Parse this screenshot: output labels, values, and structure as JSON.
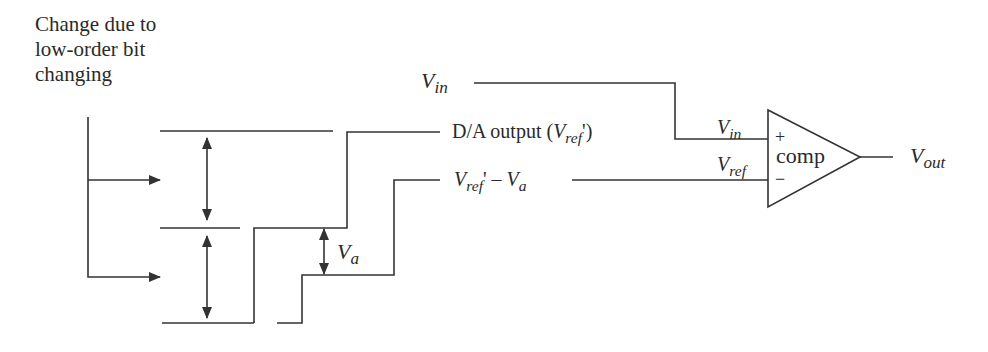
{
  "annotation": {
    "text": "Change due to low-order bit changing"
  },
  "signals": {
    "vin_left": {
      "main": "V",
      "sub": "in"
    },
    "da_output": {
      "prefix": "D/A output (",
      "main": "V",
      "sub": "ref",
      "suffix": "')"
    },
    "vref_minus_va": {
      "main": "V",
      "sub": "ref",
      "mid": "' – ",
      "main2": "V",
      "sub2": "a"
    },
    "va_step": {
      "main": "V",
      "sub": "a"
    },
    "vin_comp": {
      "main": "V",
      "sub": "in"
    },
    "vref_comp": {
      "main": "V",
      "sub": "ref"
    },
    "vout": {
      "main": "V",
      "sub": "out"
    }
  },
  "comparator": {
    "label": "comp",
    "plus": "+",
    "minus": "−"
  },
  "colors": {
    "line": "#333333",
    "text": "#2a2a2a",
    "background": "#ffffff"
  }
}
